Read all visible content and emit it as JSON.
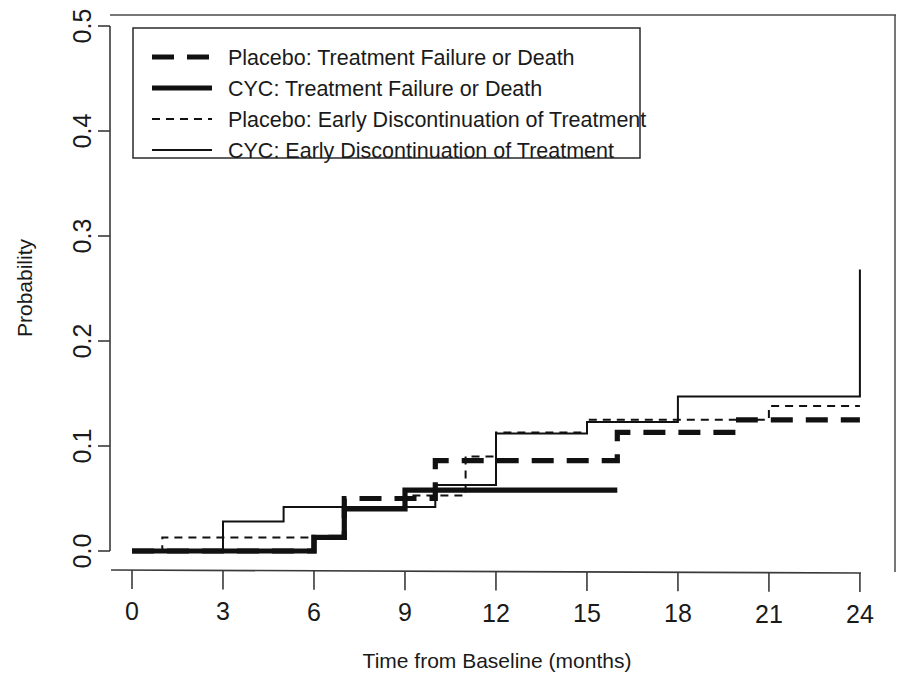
{
  "chart_data": {
    "type": "line",
    "title": "",
    "xlabel": "Time from Baseline (months)",
    "ylabel": "Probability",
    "xlim": [
      0,
      24.5
    ],
    "ylim": [
      0.0,
      0.5
    ],
    "grid": false,
    "legend_position": "top-left",
    "xticks": [
      "0",
      "3",
      "6",
      "9",
      "12",
      "15",
      "18",
      "21",
      "24"
    ],
    "xtick_values": [
      0,
      3,
      6,
      9,
      12,
      15,
      18,
      21,
      24
    ],
    "yticks": [
      "0.0",
      "0.1",
      "0.2",
      "0.3",
      "0.4",
      "0.5"
    ],
    "ytick_values": [
      0.0,
      0.1,
      0.2,
      0.3,
      0.4,
      0.5
    ],
    "series": [
      {
        "name": "Placebo: Treatment Failure or Death",
        "style": "dashed-thick",
        "steps": [
          [
            0,
            0.0
          ],
          [
            6,
            0.0
          ],
          [
            6,
            0.013
          ],
          [
            7,
            0.013
          ],
          [
            7,
            0.05
          ],
          [
            10,
            0.05
          ],
          [
            10,
            0.086
          ],
          [
            16,
            0.086
          ],
          [
            16,
            0.113
          ],
          [
            20,
            0.113
          ],
          [
            20,
            0.125
          ],
          [
            24,
            0.125
          ]
        ]
      },
      {
        "name": "CYC: Treatment Failure or Death",
        "style": "solid-thick",
        "steps": [
          [
            0,
            0.0
          ],
          [
            6,
            0.0
          ],
          [
            6,
            0.013
          ],
          [
            7,
            0.013
          ],
          [
            7,
            0.04
          ],
          [
            9,
            0.04
          ],
          [
            9,
            0.058
          ],
          [
            16,
            0.058
          ]
        ]
      },
      {
        "name": "Placebo: Early Discontinuation of Treatment",
        "style": "dashed-thin",
        "steps": [
          [
            0,
            0.0
          ],
          [
            1,
            0.0
          ],
          [
            1,
            0.013
          ],
          [
            7,
            0.013
          ],
          [
            7,
            0.04
          ],
          [
            9,
            0.04
          ],
          [
            9,
            0.053
          ],
          [
            11,
            0.053
          ],
          [
            11,
            0.09
          ],
          [
            12,
            0.09
          ],
          [
            12,
            0.113
          ],
          [
            15,
            0.113
          ],
          [
            15,
            0.125
          ],
          [
            21,
            0.125
          ],
          [
            21,
            0.138
          ],
          [
            24,
            0.138
          ]
        ]
      },
      {
        "name": "CYC: Early Discontinuation of Treatment",
        "style": "solid-thin",
        "steps": [
          [
            0,
            0.0
          ],
          [
            3,
            0.0
          ],
          [
            3,
            0.028
          ],
          [
            5,
            0.028
          ],
          [
            5,
            0.042
          ],
          [
            10,
            0.042
          ],
          [
            10,
            0.063
          ],
          [
            12,
            0.063
          ],
          [
            12,
            0.112
          ],
          [
            15,
            0.112
          ],
          [
            15,
            0.123
          ],
          [
            18,
            0.123
          ],
          [
            18,
            0.147
          ],
          [
            24,
            0.147
          ],
          [
            24,
            0.268
          ]
        ]
      }
    ]
  },
  "legend": {
    "entries": [
      {
        "label": "Placebo: Treatment Failure or Death",
        "style": "dashed-thick"
      },
      {
        "label": "CYC: Treatment Failure or Death",
        "style": "solid-thick"
      },
      {
        "label": "Placebo: Early Discontinuation of Treatment",
        "style": "dashed-thin"
      },
      {
        "label": "CYC: Early Discontinuation of Treatment",
        "style": "solid-thin"
      }
    ]
  }
}
